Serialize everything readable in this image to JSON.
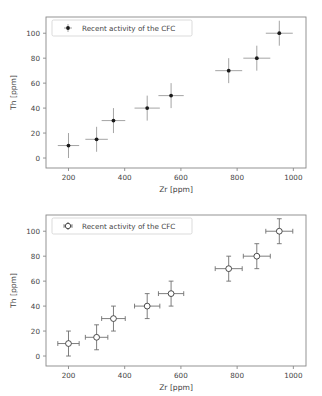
{
  "figures": [
    {
      "id": "top",
      "legend_label": "Recent activity of the CFC",
      "marker_style": "filled-plus",
      "xlabel": "Zr [ppm]",
      "ylabel": "Th [ppm]"
    },
    {
      "id": "bottom",
      "legend_label": "Recent activity of the CFC",
      "marker_style": "open-circle",
      "xlabel": "Zr [ppm]",
      "ylabel": "Th [ppm]"
    }
  ],
  "chart_data": [
    {
      "type": "scatter",
      "title": "",
      "xlabel": "Zr [ppm]",
      "ylabel": "Th [ppm]",
      "xlim": [
        120,
        1045
      ],
      "ylim": [
        -8,
        113
      ],
      "xticks": [
        200,
        400,
        600,
        800,
        1000
      ],
      "yticks": [
        0,
        20,
        40,
        60,
        80,
        100
      ],
      "grid": false,
      "legend_position": "upper left",
      "marker": "filled-plus",
      "series": [
        {
          "name": "Recent activity of the CFC",
          "x": [
            200,
            300,
            360,
            480,
            565,
            770,
            870,
            950
          ],
          "y": [
            10,
            15,
            30,
            40,
            50,
            70,
            80,
            100
          ],
          "xerr": [
            38,
            40,
            42,
            45,
            45,
            48,
            48,
            48
          ],
          "yerr": [
            10,
            10,
            10,
            10,
            10,
            10,
            10,
            10
          ]
        }
      ]
    },
    {
      "type": "scatter",
      "title": "",
      "xlabel": "Zr [ppm]",
      "ylabel": "Th [ppm]",
      "xlim": [
        120,
        1045
      ],
      "ylim": [
        -8,
        113
      ],
      "xticks": [
        200,
        400,
        600,
        800,
        1000
      ],
      "yticks": [
        0,
        20,
        40,
        60,
        80,
        100
      ],
      "grid": false,
      "legend_position": "upper left",
      "marker": "open-circle",
      "series": [
        {
          "name": "Recent activity of the CFC",
          "x": [
            200,
            300,
            360,
            480,
            565,
            770,
            870,
            950
          ],
          "y": [
            10,
            15,
            30,
            40,
            50,
            70,
            80,
            100
          ],
          "xerr": [
            38,
            40,
            42,
            45,
            45,
            48,
            48,
            48
          ],
          "yerr": [
            10,
            10,
            10,
            10,
            10,
            10,
            10,
            10
          ]
        }
      ]
    }
  ]
}
